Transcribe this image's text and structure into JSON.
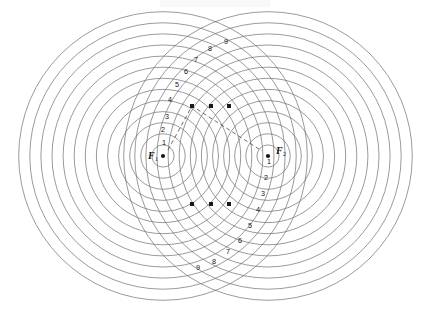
{
  "figure": {
    "type": "geometric-construction",
    "background_color": "#ffffff",
    "stroke_color": "#6f6f72",
    "marker_color": "#1a1a1c",
    "dash_color": "#5a5a5e",
    "width": 421,
    "height": 309
  },
  "foci": [
    {
      "id": "F1",
      "label": "F",
      "subscript": "1",
      "cx": 163,
      "cy": 156,
      "label_x": 148,
      "label_y": 157,
      "ring_count": 13,
      "ring_step": 11.1
    },
    {
      "id": "F2",
      "label": "F",
      "subscript": "2",
      "cx": 268,
      "cy": 156,
      "label_x": 276,
      "label_y": 152,
      "ring_count": 13,
      "ring_step": 11.1
    }
  ],
  "ring_labels_f1": {
    "description": "Radius index labels for circles centred on F1, running up and to the right",
    "values": [
      "1",
      "2",
      "3",
      "4",
      "5",
      "6",
      "7",
      "8",
      "9"
    ],
    "positions": [
      {
        "n": "1",
        "x": 164,
        "y": 143
      },
      {
        "n": "2",
        "x": 163,
        "y": 130
      },
      {
        "n": "3",
        "x": 167,
        "y": 117
      },
      {
        "n": "4",
        "x": 170,
        "y": 100
      },
      {
        "n": "5",
        "x": 177,
        "y": 85
      },
      {
        "n": "6",
        "x": 186,
        "y": 72
      },
      {
        "n": "7",
        "x": 196,
        "y": 60
      },
      {
        "n": "8",
        "x": 210,
        "y": 49
      },
      {
        "n": "9",
        "x": 226,
        "y": 42
      }
    ]
  },
  "ring_labels_f2": {
    "description": "Radius index labels for circles centred on F2, running down and to the left",
    "values": [
      "1",
      "2",
      "3",
      "4",
      "5",
      "6",
      "7",
      "8",
      "9"
    ],
    "positions": [
      {
        "n": "1",
        "x": 269,
        "y": 162
      },
      {
        "n": "2",
        "x": 266,
        "y": 178
      },
      {
        "n": "3",
        "x": 263,
        "y": 194
      },
      {
        "n": "4",
        "x": 258,
        "y": 210
      },
      {
        "n": "5",
        "x": 250,
        "y": 226
      },
      {
        "n": "6",
        "x": 240,
        "y": 241
      },
      {
        "n": "7",
        "x": 228,
        "y": 252
      },
      {
        "n": "8",
        "x": 214,
        "y": 262
      },
      {
        "n": "9",
        "x": 198,
        "y": 268
      }
    ]
  },
  "node_markers": {
    "description": "Square markers at circle intersection points forming a locus",
    "size": 4,
    "points": [
      {
        "x": 192,
        "y": 106
      },
      {
        "x": 211,
        "y": 106
      },
      {
        "x": 229,
        "y": 106
      },
      {
        "x": 192,
        "y": 204
      },
      {
        "x": 211,
        "y": 204
      },
      {
        "x": 229,
        "y": 204
      }
    ]
  },
  "dashed_path": {
    "description": "Dashed construction line from F1 up to the marker row and down to F2",
    "points": [
      {
        "x": 168,
        "y": 150
      },
      {
        "x": 192,
        "y": 106
      },
      {
        "x": 262,
        "y": 151
      }
    ]
  }
}
